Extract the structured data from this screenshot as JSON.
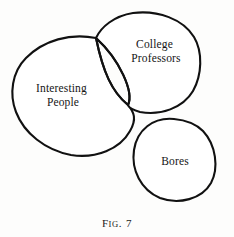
{
  "figure": {
    "caption": {
      "label_lead": "F",
      "label_rest": "IG",
      "separator": ".",
      "number": "7",
      "full_text": "Fig. 7"
    },
    "background_color": "#fdfdfc",
    "stroke_color": "#111111",
    "hatch_color": "#151515",
    "regions": [
      {
        "id": "interesting-people",
        "label_line_1": "Interesting",
        "label_line_2": "People",
        "label_x": 63,
        "label_y": 92,
        "fill": "#ffffff",
        "hatched": false
      },
      {
        "id": "college-professors",
        "label_line_1": "College",
        "label_line_2": "Professors",
        "label_x": 156,
        "label_y": 48,
        "fill": "#ffffff",
        "hatched": false
      },
      {
        "id": "bores",
        "label_line_1": "Bores",
        "label_line_2": "",
        "label_x": 175,
        "label_y": 161,
        "fill": "#ffffff",
        "hatched": false
      },
      {
        "id": "interesting-professors-intersection",
        "label_line_1": "",
        "label_line_2": "",
        "label_x": 0,
        "label_y": 0,
        "fill": "hatch",
        "hatched": true
      }
    ]
  }
}
